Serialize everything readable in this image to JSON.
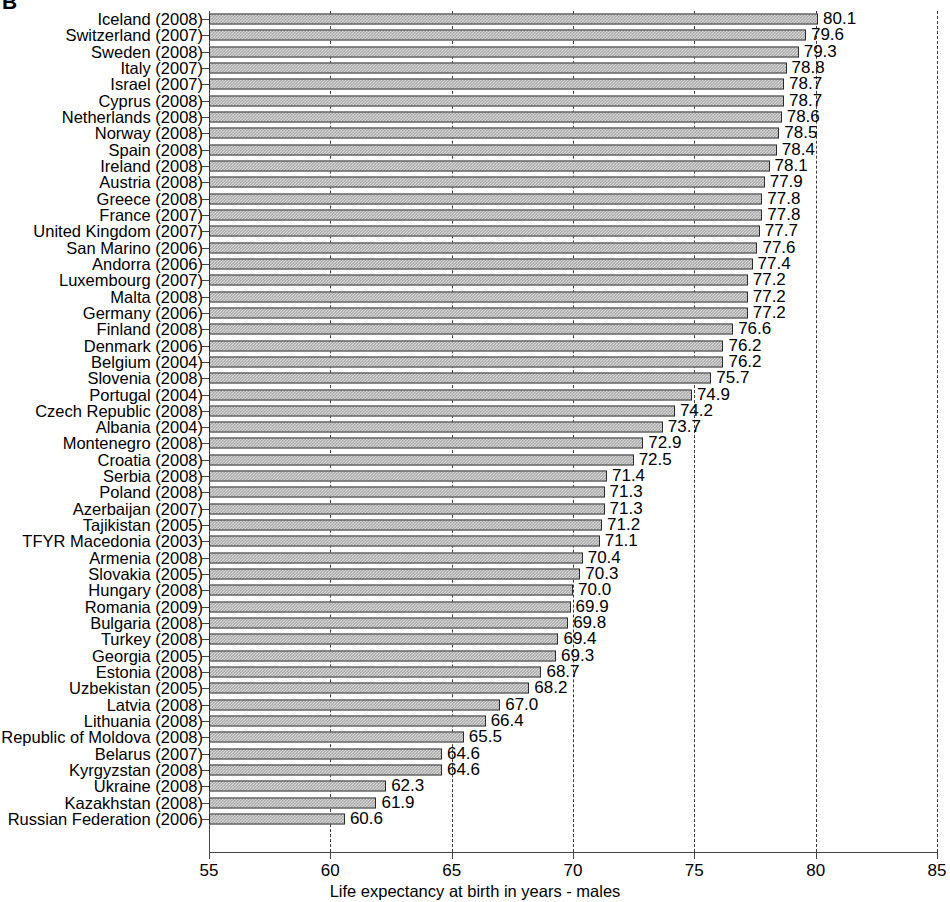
{
  "panel_letter": "B",
  "chart_data": {
    "type": "bar",
    "orientation": "horizontal",
    "title": "",
    "xlabel": "Life expectancy at birth in years - males",
    "ylabel": "",
    "xlim": [
      55,
      85
    ],
    "xticks": [
      55,
      60,
      65,
      70,
      75,
      80,
      85
    ],
    "grid": "dashed vertical gridlines at each x tick",
    "legend": "none",
    "bar_fill_color": "#d5d5d5",
    "bar_edge_color": "#2b2b2b",
    "categories": [
      "Iceland (2008)",
      "Switzerland (2007)",
      "Sweden (2008)",
      "Italy (2007)",
      "Israel (2007)",
      "Cyprus (2008)",
      "Netherlands (2008)",
      "Norway (2008)",
      "Spain (2008)",
      "Ireland (2008)",
      "Austria (2008)",
      "Greece (2008)",
      "France (2007)",
      "United Kingdom (2007)",
      "San Marino (2006)",
      "Andorra (2006)",
      "Luxembourg (2007)",
      "Malta (2008)",
      "Germany (2006)",
      "Finland (2008)",
      "Denmark (2006)",
      "Belgium (2004)",
      "Slovenia (2008)",
      "Portugal (2004)",
      "Czech Republic (2008)",
      "Albania (2004)",
      "Montenegro (2008)",
      "Croatia (2008)",
      "Serbia (2008)",
      "Poland (2008)",
      "Azerbaijan (2007)",
      "Tajikistan (2005)",
      "TFYR Macedonia (2003)",
      "Armenia (2008)",
      "Slovakia (2005)",
      "Hungary (2008)",
      "Romania (2009)",
      "Bulgaria (2008)",
      "Turkey (2008)",
      "Georgia (2005)",
      "Estonia (2008)",
      "Uzbekistan (2005)",
      "Latvia (2008)",
      "Lithuania (2008)",
      "Republic of Moldova (2008)",
      "Belarus (2007)",
      "Kyrgyzstan (2008)",
      "Ukraine (2008)",
      "Kazakhstan (2008)",
      "Russian Federation (2006)"
    ],
    "values": [
      80.1,
      79.6,
      79.3,
      78.8,
      78.7,
      78.7,
      78.6,
      78.5,
      78.4,
      78.1,
      77.9,
      77.8,
      77.8,
      77.7,
      77.6,
      77.4,
      77.2,
      77.2,
      77.2,
      76.6,
      76.2,
      76.2,
      75.7,
      74.9,
      74.2,
      73.7,
      72.9,
      72.5,
      71.4,
      71.3,
      71.3,
      71.2,
      71.1,
      70.4,
      70.3,
      70.0,
      69.9,
      69.8,
      69.4,
      69.3,
      68.7,
      68.2,
      67.0,
      66.4,
      65.5,
      64.6,
      64.6,
      62.3,
      61.9,
      60.6
    ],
    "value_labels": [
      "80.1",
      "79.6",
      "79.3",
      "78.8",
      "78.7",
      "78.7",
      "78.6",
      "78.5",
      "78.4",
      "78.1",
      "77.9",
      "77.8",
      "77.8",
      "77.7",
      "77.6",
      "77.4",
      "77.2",
      "77.2",
      "77.2",
      "76.6",
      "76.2",
      "76.2",
      "75.7",
      "74.9",
      "74.2",
      "73.7",
      "72.9",
      "72.5",
      "71.4",
      "71.3",
      "71.3",
      "71.2",
      "71.1",
      "70.4",
      "70.3",
      "70.0",
      "69.9",
      "69.8",
      "69.4",
      "69.3",
      "68.7",
      "68.2",
      "67.0",
      "66.4",
      "65.5",
      "64.6",
      "64.6",
      "62.3",
      "61.9",
      "60.6"
    ],
    "xtick_labels": [
      "55",
      "60",
      "65",
      "70",
      "75",
      "80",
      "85"
    ]
  }
}
